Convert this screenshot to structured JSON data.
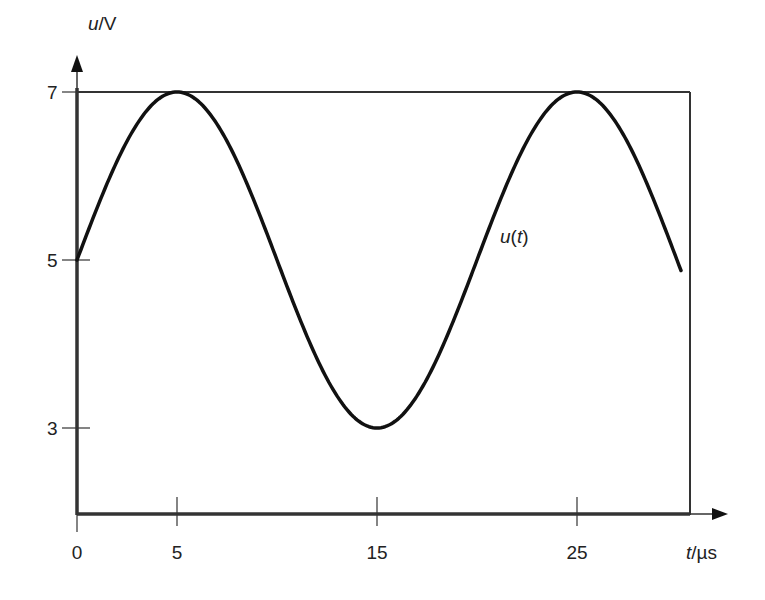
{
  "chart_data": {
    "type": "line",
    "title": "",
    "xlabel": "t/µs",
    "ylabel": "u/V",
    "xlabel_parts": {
      "var": "t",
      "unit": "/µs"
    },
    "ylabel_parts": {
      "var": "u",
      "unit": "/V"
    },
    "xticks": [
      0,
      5,
      15,
      25
    ],
    "yticks": [
      3,
      5,
      7
    ],
    "xlim": [
      0,
      30.65
    ],
    "ylim": [
      2,
      7
    ],
    "grid": false,
    "legend": null,
    "annotations": [
      {
        "text": "u(t)",
        "var": "u",
        "arg": "t",
        "x": 21.3,
        "y": 5.2
      }
    ],
    "series": [
      {
        "name": "u(t)",
        "formula": "u(t) = 5 + 2·sin(2π·t/20)",
        "offset": 5,
        "amplitude": 2,
        "period": 20,
        "t_start": 0,
        "t_end": 30.2,
        "x": [
          0,
          2.5,
          5,
          7.5,
          10,
          12.5,
          15,
          17.5,
          20,
          22.5,
          25,
          27.5,
          30
        ],
        "values": [
          5,
          6.41,
          7,
          6.41,
          5,
          3.59,
          3,
          3.59,
          5,
          6.41,
          7,
          6.41,
          5.06
        ]
      }
    ]
  },
  "labels": {
    "y_axis_var": "u",
    "y_axis_unit": "/V",
    "x_axis_var": "t",
    "x_axis_unit": "/µs",
    "curve_var": "u",
    "curve_open": "(",
    "curve_arg": "t",
    "curve_close": ")",
    "ytick_7": "7",
    "ytick_5": "5",
    "ytick_3": "3",
    "xtick_0": "0",
    "xtick_5": "5",
    "xtick_15": "15",
    "xtick_25": "25"
  }
}
